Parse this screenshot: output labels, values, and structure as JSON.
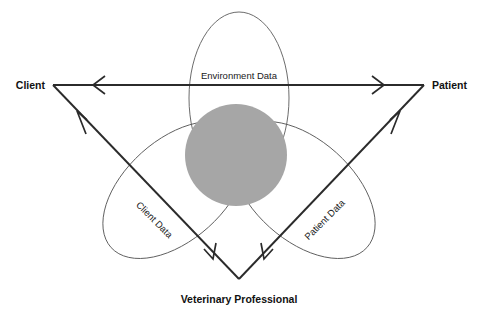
{
  "diagram": {
    "background_color": "#ffffff",
    "stroke_color": "#2b2b2b",
    "ellipse_stroke_color": "#5b5b5b",
    "center_disc_color": "#a6a6a6",
    "vertices": [
      {
        "id": "client",
        "label": "Client",
        "x": 53,
        "y": 85,
        "anchor": "end"
      },
      {
        "id": "patient",
        "label": "Patient",
        "x": 424,
        "y": 85,
        "anchor": "start"
      },
      {
        "id": "veterinary-professional",
        "label": "Veterinary Professional",
        "x": 239,
        "y": 279,
        "anchor": "middle"
      }
    ],
    "flows": [
      {
        "id": "environment-data",
        "label": "Environment Data",
        "rotation": 0,
        "x": 239,
        "y": 76
      },
      {
        "id": "client-data",
        "label": "Client Data",
        "rotation": 45,
        "x": 152,
        "y": 222
      },
      {
        "id": "patient-data",
        "label": "Patient Data",
        "rotation": -45,
        "x": 327,
        "y": 222
      }
    ],
    "ellipses": [
      {
        "id": "environment-ellipse",
        "cx": 239,
        "cy": 98,
        "rx": 50,
        "ry": 86,
        "rotation": 0
      },
      {
        "id": "client-ellipse",
        "cx": 175,
        "cy": 190,
        "rx": 86,
        "ry": 50,
        "rotation": -42
      },
      {
        "id": "patient-ellipse",
        "cx": 303,
        "cy": 190,
        "rx": 86,
        "ry": 50,
        "rotation": 42
      }
    ],
    "center": {
      "id": "shared-data-core",
      "cx": 236,
      "cy": 155,
      "r": 51
    }
  }
}
